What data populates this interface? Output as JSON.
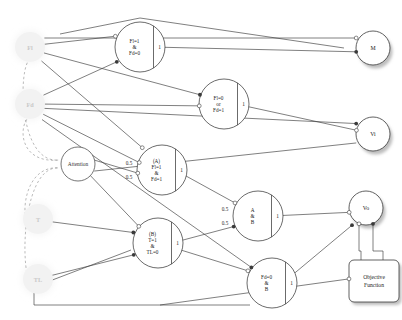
{
  "diagram": {
    "type": "logic-neural-network",
    "input_nodes": [
      {
        "id": "Fl",
        "label": "Fl",
        "cx": 30,
        "cy": 47,
        "r": 15,
        "style": "faded"
      },
      {
        "id": "Fd",
        "label": "Fd",
        "cx": 30,
        "cy": 104,
        "r": 15,
        "style": "faded"
      },
      {
        "id": "T",
        "label": "T",
        "cx": 38,
        "cy": 219,
        "r": 15,
        "style": "faded"
      },
      {
        "id": "TL",
        "label": "TL",
        "cx": 38,
        "cy": 279,
        "r": 15,
        "style": "faded"
      }
    ],
    "attention_node": {
      "id": "Attention",
      "label": "Attention",
      "cx": 78,
      "cy": 164,
      "r": 17
    },
    "gate_nodes": [
      {
        "id": "G1",
        "cx": 140,
        "cy": 47,
        "r": 25,
        "threshold": "1",
        "lines": [
          "Fl=1",
          "&",
          "Fd=0"
        ],
        "weights": []
      },
      {
        "id": "G2",
        "cx": 224,
        "cy": 104,
        "r": 25,
        "threshold": "1",
        "lines": [
          "Fl=0",
          "or",
          "Fd=1"
        ],
        "weights": []
      },
      {
        "id": "G3",
        "cx": 162,
        "cy": 170,
        "r": 25,
        "threshold": "1",
        "lines": [
          "(A)",
          "Fl=1",
          "&",
          "Fd=1"
        ],
        "weights": [
          "0.5",
          "0.5"
        ]
      },
      {
        "id": "G4",
        "cx": 158,
        "cy": 243,
        "r": 25,
        "threshold": "1",
        "lines": [
          "(B)",
          "T=1",
          "&",
          "TL=0"
        ],
        "weights": []
      },
      {
        "id": "G5",
        "cx": 258,
        "cy": 216,
        "r": 25,
        "threshold": "1",
        "lines": [
          "A",
          "&",
          "B"
        ],
        "weights": [
          "0.5",
          "0.5"
        ]
      },
      {
        "id": "G6",
        "cx": 272,
        "cy": 283,
        "r": 25,
        "threshold": "1",
        "lines": [
          "Fd=0",
          "&",
          "B"
        ],
        "weights": []
      }
    ],
    "output_nodes": [
      {
        "id": "M",
        "label": "M",
        "cx": 373,
        "cy": 48,
        "r": 17
      },
      {
        "id": "Vi",
        "label": "Vi",
        "cx": 373,
        "cy": 134,
        "r": 17
      },
      {
        "id": "Vo",
        "label": "Vo",
        "cx": 366,
        "cy": 208,
        "r": 17
      }
    ],
    "objective_box": {
      "id": "ObjectiveFunction",
      "lines": [
        "Objective",
        "Function"
      ],
      "x": 349,
      "y": 260,
      "w": 50,
      "h": 42
    },
    "colors": {
      "stroke": "#3a3a3a",
      "faded_fill": "#f2f2f2",
      "faded_text": "#c8c8c8",
      "node_fill": "#ffffff",
      "shadow": "#bdbdbd",
      "background": "#ffffff",
      "dashed": "#8c8c8c"
    },
    "legend": {
      "excitatory": "filled-terminal",
      "inhibitory": "hollow-terminal",
      "dashed_edge": "attention-modulation"
    }
  }
}
